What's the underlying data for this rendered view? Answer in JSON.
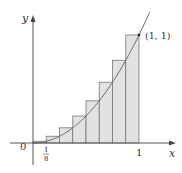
{
  "figure": {
    "type": "riemann-sum-diagram",
    "function": "y = x^2",
    "interval": [
      0,
      1
    ],
    "n_rectangles": 8,
    "sum_type": "right-endpoint (upper)",
    "axes": {
      "x_label": "x",
      "y_label": "y",
      "origin_label": "0",
      "x_tick_labels": [
        {
          "num": "1",
          "den": "8",
          "value": 0.125
        },
        {
          "text": "1",
          "value": 1
        }
      ]
    },
    "point_label": "(1, 1)",
    "colors": {
      "rect_fill": "#e2e2e2",
      "rect_stroke": "#777777",
      "curve": "#666666",
      "axis": "#555555"
    }
  },
  "chart_data": {
    "type": "bar",
    "title": "",
    "xlabel": "x",
    "ylabel": "y",
    "categories": [
      "1/8",
      "2/8",
      "3/8",
      "4/8",
      "5/8",
      "6/8",
      "7/8",
      "1"
    ],
    "values": [
      0.015625,
      0.0625,
      0.140625,
      0.25,
      0.390625,
      0.5625,
      0.765625,
      1.0
    ],
    "curve": "y = x^2",
    "xlim": [
      0,
      1
    ],
    "ylim": [
      0,
      1
    ],
    "annotations": [
      "(1, 1)"
    ],
    "grid": false
  }
}
